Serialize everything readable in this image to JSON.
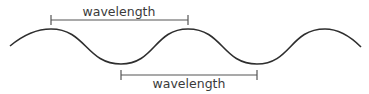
{
  "diagram": {
    "wave": {
      "type": "sine",
      "cycles_shown": 2.5
    },
    "measurements": [
      {
        "label": "wavelength",
        "from": "crest",
        "to": "next crest",
        "position": "above"
      },
      {
        "label": "wavelength",
        "from": "trough",
        "to": "next trough",
        "position": "below"
      }
    ]
  }
}
